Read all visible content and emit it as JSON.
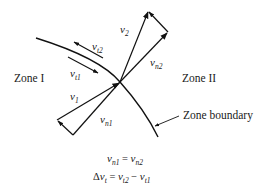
{
  "diagram": {
    "zones": {
      "left": "Zone I",
      "right": "Zone II"
    },
    "boundary_label": "Zone boundary",
    "vectors": {
      "v1": {
        "base": "v",
        "sub": "1"
      },
      "v2": {
        "base": "v",
        "sub": "2"
      },
      "vn1": {
        "base": "v",
        "sub": "n1"
      },
      "vn2": {
        "base": "v",
        "sub": "n2"
      },
      "vt1": {
        "base": "v",
        "sub": "t1"
      },
      "vt2": {
        "base": "v",
        "sub": "t2"
      }
    },
    "equations": {
      "eq1": {
        "lhs_base": "v",
        "lhs_sub": "n1",
        "op": " = ",
        "rhs_base": "v",
        "rhs_sub": "n2"
      },
      "eq2": {
        "delta": "Δ",
        "lhs_base": "v",
        "lhs_sub": "t",
        "op": " = ",
        "a_base": "v",
        "a_sub": "t2",
        "minus": " − ",
        "b_base": "v",
        "b_sub": "t1"
      }
    },
    "colors": {
      "stroke": "#111111",
      "background": "#ffffff"
    }
  }
}
